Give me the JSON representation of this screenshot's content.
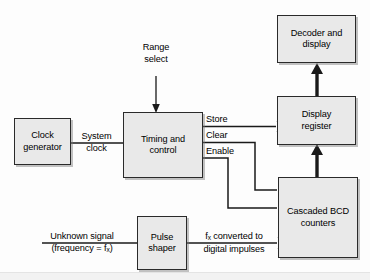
{
  "diagram": {
    "background_color": "#fdfdfd",
    "block_fill": "#e9e9e9",
    "block_border": "#2a2a2a",
    "line_color": "#1a1a1a"
  },
  "blocks": [
    {
      "id": "clock-generator",
      "line1": "Clock",
      "line2": "generator",
      "x": 14,
      "y": 118,
      "w": 57,
      "h": 47
    },
    {
      "id": "timing-and-control",
      "line1": "Timing and",
      "line2": "control",
      "x": 123,
      "y": 112,
      "w": 80,
      "h": 66
    },
    {
      "id": "decoder-and-display",
      "line1": "Decoder and",
      "line2": "display",
      "x": 277,
      "y": 15,
      "w": 79,
      "h": 48
    },
    {
      "id": "display-register",
      "line1": "Display",
      "line2": "register",
      "x": 277,
      "y": 96,
      "w": 79,
      "h": 49
    },
    {
      "id": "cascaded-bcd-counters",
      "line1": "Cascaded BCD",
      "line2": "counters",
      "x": 278,
      "y": 177,
      "w": 80,
      "h": 81
    },
    {
      "id": "pulse-shaper",
      "line1": "Pulse",
      "line2": "shaper",
      "x": 137,
      "y": 216,
      "w": 50,
      "h": 54
    }
  ],
  "labels": {
    "range_select_line1": "Range",
    "range_select_line2": "select",
    "system_clock_line1": "System",
    "system_clock_line2": "clock",
    "store": "Store",
    "clear": "Clear",
    "enable": "Enable",
    "unknown_signal_line1": "Unknown signal",
    "unknown_signal_line2_pre": "(frequency = f",
    "unknown_signal_sub": "x",
    "unknown_signal_line2_post": ")",
    "fx_converted_pre": "f",
    "fx_converted_sub": "x",
    "fx_converted_post": " converted to",
    "digital_impulses": "digital impulses"
  },
  "connections": [
    {
      "name": "range-select-arrow",
      "from": "Range select label",
      "to": "timing-and-control",
      "style": "thin-arrow",
      "direction": "down"
    },
    {
      "name": "system-clock-line",
      "from": "clock-generator",
      "to": "timing-and-control",
      "style": "thin-line",
      "direction": "right"
    },
    {
      "name": "store-line",
      "from": "timing-and-control",
      "to": "display-register",
      "style": "thin-line",
      "direction": "right"
    },
    {
      "name": "clear-line",
      "from": "timing-and-control",
      "to": "cascaded-bcd-counters",
      "style": "thin-line",
      "direction": "right-down"
    },
    {
      "name": "enable-line",
      "from": "timing-and-control",
      "to": "cascaded-bcd-counters",
      "style": "thin-line",
      "direction": "right-down"
    },
    {
      "name": "bcd-to-register-arrow",
      "from": "cascaded-bcd-counters",
      "to": "display-register",
      "style": "thick-arrow",
      "direction": "up"
    },
    {
      "name": "register-to-decoder-arrow",
      "from": "display-register",
      "to": "decoder-and-display",
      "style": "thick-arrow",
      "direction": "up"
    },
    {
      "name": "unknown-signal-line",
      "from": "Unknown signal",
      "to": "pulse-shaper",
      "style": "thin-line",
      "direction": "right"
    },
    {
      "name": "shaper-to-bcd-line",
      "from": "pulse-shaper",
      "to": "cascaded-bcd-counters",
      "style": "thin-line",
      "direction": "right"
    }
  ]
}
